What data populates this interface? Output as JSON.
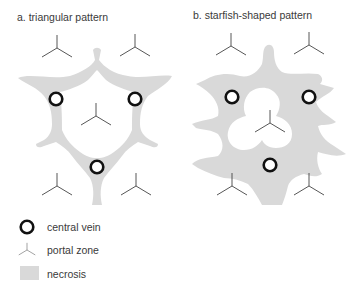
{
  "panels": {
    "a": {
      "title": "a. triangular pattern"
    },
    "b": {
      "title": "b. starfish-shaped pattern"
    }
  },
  "legend": [
    {
      "symbol": "central-vein-icon",
      "label": "central vein"
    },
    {
      "symbol": "portal-zone-icon",
      "label": "portal zone"
    },
    {
      "symbol": "necrosis-swatch",
      "label": "necrosis"
    }
  ],
  "colors": {
    "necrosis": "#d9d9d9",
    "central_vein_stroke": "#111111",
    "portal_stroke": "#444444",
    "text": "#3a3a3a"
  }
}
